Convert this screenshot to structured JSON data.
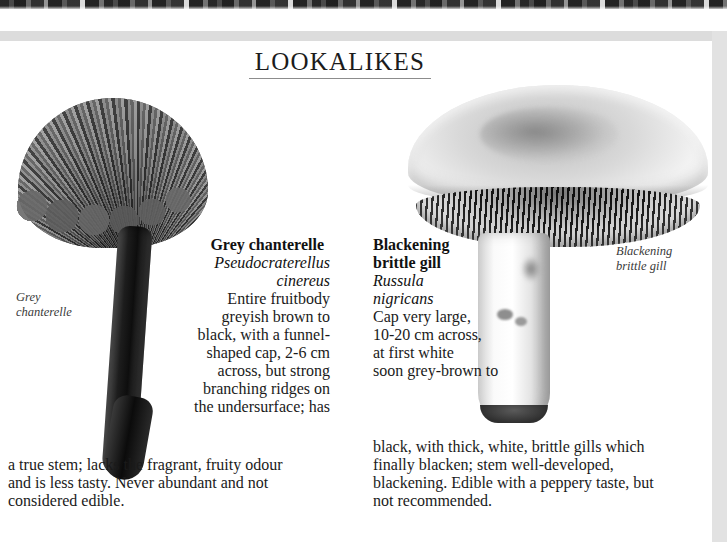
{
  "page": {
    "heading": "LOOKALIKES"
  },
  "captions": {
    "chanterelle_line1": "Grey",
    "chanterelle_line2": "chanterelle",
    "russula_line1": "Blackening",
    "russula_line2": "brittle gill"
  },
  "species": [
    {
      "id": "grey-chanterelle",
      "common_name": "Grey chanterelle",
      "latin_line1": "Pseudocraterellus",
      "latin_line2": "cinereus",
      "description_lines": [
        "Entire fruitbody",
        "greyish brown to",
        "black, with a funnel-",
        "shaped cap, 2-6 cm",
        "across, but strong",
        "branching ridges on",
        "the undersurface; has"
      ],
      "description_tail_lines": [
        "a true stem; lacks the fragrant, fruity odour",
        "and is less tasty. Never abundant and not",
        "considered edible."
      ],
      "description_full": "Entire fruitbody greyish brown to black, with a funnel-shaped cap, 2-6 cm across, but strong branching ridges on the undersurface; has a true stem; lacks the fragrant, fruity odour and is less tasty. Never abundant and not considered edible."
    },
    {
      "id": "blackening-brittle-gill",
      "common_name_line1": "Blackening",
      "common_name_line2": "brittle gill",
      "common_name": "Blackening brittle gill",
      "latin_line1": "Russula",
      "latin_line2": "nigricans",
      "description_lines": [
        "Cap very large,",
        "10-20 cm across,",
        "at first white",
        "soon grey-brown to"
      ],
      "description_tail_lines": [
        "black, with thick, white, brittle gills which",
        "finally blacken; stem well-developed,",
        "blackening. Edible with a peppery taste, but",
        "not recommended."
      ],
      "description_full": "Cap very large, 10-20 cm across, at first white soon grey-brown to black, with thick, white, brittle gills which finally blacken; stem well-developed, blackening. Edible with a peppery taste, but not recommended."
    }
  ],
  "illustrations": [
    {
      "id": "chanterelle-illustration",
      "label": "grey-chanterelle-drawing"
    },
    {
      "id": "russula-illustration",
      "label": "blackening-brittle-gill-drawing"
    }
  ],
  "colors": {
    "page_background": "#ffffff",
    "text": "#1a1a1a",
    "scan_margin": "#dcdcdc",
    "rule": "#8c8c8c"
  }
}
